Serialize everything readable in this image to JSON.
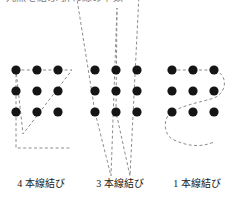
{
  "figure": {
    "top_caption_fragment": "九点を結ぶ 折れ線の本数",
    "background_color": "#ffffff",
    "dot_color": "#151515",
    "line_color": "#8c8c8c",
    "dot_radius": 4.6,
    "grid": {
      "rows": 3,
      "cols": 3,
      "spacing": 21,
      "origin_x": 14,
      "origin_y": 70
    }
  },
  "panels": [
    {
      "id": "panel-four-lines",
      "label": "4 本線結び",
      "line_count": 4,
      "dots": [
        {
          "row": 0,
          "col": 0
        },
        {
          "row": 0,
          "col": 1
        },
        {
          "row": 0,
          "col": 2
        },
        {
          "row": 1,
          "col": 0
        },
        {
          "row": 1,
          "col": 1
        },
        {
          "row": 1,
          "col": 2
        },
        {
          "row": 2,
          "col": 0
        },
        {
          "row": 2,
          "col": 1
        },
        {
          "row": 2,
          "col": 2
        }
      ],
      "path_points": [
        {
          "x": 14,
          "y": 70
        },
        {
          "x": 70,
          "y": 70
        },
        {
          "x": 21,
          "y": 134
        },
        {
          "x": 14,
          "y": 70
        },
        {
          "x": 14,
          "y": 148
        },
        {
          "x": 69,
          "y": 148
        }
      ]
    },
    {
      "id": "panel-three-lines",
      "label": "3 本線結び",
      "line_count": 3,
      "dots": [
        {
          "row": 0,
          "col": 0
        },
        {
          "row": 0,
          "col": 1
        },
        {
          "row": 0,
          "col": 2
        },
        {
          "row": 1,
          "col": 0
        },
        {
          "row": 1,
          "col": 1
        },
        {
          "row": 1,
          "col": 2
        },
        {
          "row": 2,
          "col": 0
        },
        {
          "row": 2,
          "col": 1
        },
        {
          "row": 2,
          "col": 2
        }
      ],
      "path_points": [
        {
          "x": -8,
          "y": -26
        },
        {
          "x": 14,
          "y": 112
        },
        {
          "x": 30,
          "y": 176
        },
        {
          "x": 36,
          "y": 8
        },
        {
          "x": 35,
          "y": 112
        },
        {
          "x": 49,
          "y": 176
        },
        {
          "x": 59,
          "y": -26
        }
      ]
    },
    {
      "id": "panel-one-line",
      "label": "1 本線結び",
      "line_count": 1,
      "dots": [
        {
          "row": 0,
          "col": 0
        },
        {
          "row": 0,
          "col": 1
        },
        {
          "row": 0,
          "col": 2
        },
        {
          "row": 1,
          "col": 0
        },
        {
          "row": 1,
          "col": 1
        },
        {
          "row": 1,
          "col": 2
        },
        {
          "row": 2,
          "col": 0
        },
        {
          "row": 2,
          "col": 1
        },
        {
          "row": 2,
          "col": 2
        }
      ],
      "curve": "M 14 70 L 35 70 L 56 70 C 70 74 70 92 56 98 C 44 102 28 104 14 112 C 4 118 6 134 14 139 C 28 146 42 148 56 142"
    }
  ]
}
